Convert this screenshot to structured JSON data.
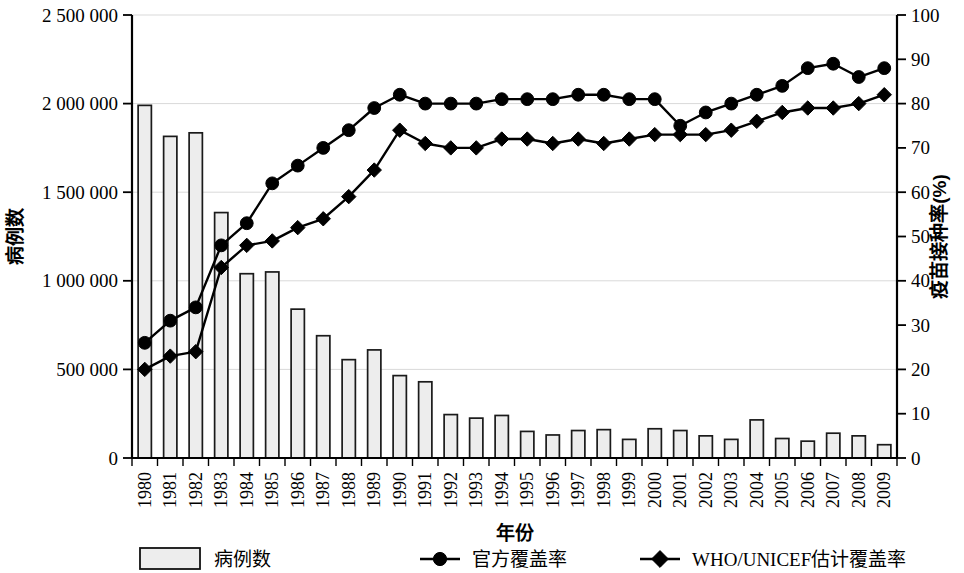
{
  "chart_data": {
    "type": "bar",
    "title": "",
    "xlabel": "年份",
    "ylabel": "病例数",
    "y2label": "疫苗接种率(%)",
    "grid": true,
    "legend_position": "bottom",
    "ylim": [
      0,
      2500000
    ],
    "y2lim": [
      0,
      100
    ],
    "y_ticks": [
      "0",
      "500 000",
      "1 000 000",
      "1 500 000",
      "2 000 000",
      "2 500 000"
    ],
    "y_tick_values": [
      0,
      500000,
      1000000,
      1500000,
      2000000,
      2500000
    ],
    "y2_ticks": [
      "0",
      "10",
      "20",
      "30",
      "40",
      "50",
      "60",
      "70",
      "80",
      "90",
      "100"
    ],
    "y2_tick_values": [
      0,
      10,
      20,
      30,
      40,
      50,
      60,
      70,
      80,
      90,
      100
    ],
    "categories": [
      "1980",
      "1981",
      "1982",
      "1983",
      "1984",
      "1985",
      "1986",
      "1987",
      "1988",
      "1989",
      "1990",
      "1991",
      "1992",
      "1993",
      "1994",
      "1995",
      "1996",
      "1997",
      "1998",
      "1999",
      "2000",
      "2001",
      "2002",
      "2003",
      "2004",
      "2005",
      "2006",
      "2007",
      "2008",
      "2009"
    ],
    "series": [
      {
        "name": "病例数",
        "type": "bar",
        "axis": "left",
        "marker": "square",
        "values": [
          1990000,
          1815000,
          1835000,
          1385000,
          1040000,
          1050000,
          840000,
          690000,
          555000,
          610000,
          465000,
          430000,
          245000,
          225000,
          240000,
          150000,
          130000,
          155000,
          160000,
          105000,
          165000,
          155000,
          125000,
          105000,
          215000,
          110000,
          95000,
          140000,
          125000,
          75000
        ]
      },
      {
        "name": "官方覆盖率",
        "type": "line",
        "axis": "right",
        "marker": "circle",
        "values": [
          26,
          31,
          34,
          48,
          53,
          62,
          66,
          70,
          74,
          79,
          82,
          80,
          80,
          80,
          81,
          81,
          81,
          82,
          82,
          81,
          81,
          75,
          78,
          80,
          82,
          84,
          88,
          89,
          86,
          88
        ]
      },
      {
        "name": "WHO/UNICEF估计覆盖率",
        "type": "line",
        "axis": "right",
        "marker": "diamond",
        "values": [
          20,
          23,
          24,
          43,
          48,
          49,
          52,
          54,
          59,
          65,
          74,
          71,
          70,
          70,
          72,
          72,
          71,
          72,
          71,
          72,
          73,
          73,
          73,
          74,
          76,
          78,
          79,
          79,
          80,
          82
        ]
      }
    ],
    "legend": [
      {
        "label": "病例数",
        "marker": "square"
      },
      {
        "label": "官方覆盖率",
        "marker": "circle"
      },
      {
        "label": "WHO/UNICEF估计覆盖率",
        "marker": "diamond"
      }
    ],
    "colors": {
      "bar_fill": "#ededed",
      "bar_stroke": "#1a1a1a",
      "line": "#000000",
      "grid": "#d9d9d9"
    }
  }
}
